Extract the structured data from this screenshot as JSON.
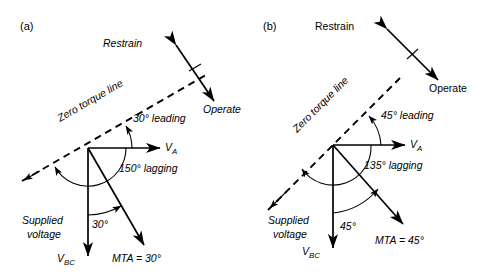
{
  "figure": {
    "type": "vector-phasor-diagram",
    "background": "#ffffff",
    "line_color": "#000000",
    "panels": [
      {
        "id": "a",
        "panel_label": "(a)",
        "labels": {
          "restrain": "Restrain",
          "operate": "Operate",
          "zero_torque_line": "Zero torque line",
          "leading_angle": "30° leading",
          "lagging_angle": "150° lagging",
          "mta_inner_angle": "30°",
          "supplied_voltage_line1": "Supplied",
          "supplied_voltage_line2": "voltage",
          "v_a_main": "V",
          "v_a_sub": "A",
          "v_bc_main": "V",
          "v_bc_sub": "BC",
          "mta": "MTA = 30°"
        },
        "angles_deg": {
          "zero_torque_line_from_va": 30,
          "mta_lagging_from_va": 150,
          "mta_from_vbc": 30,
          "va_direction": 0,
          "vbc_direction": 270
        }
      },
      {
        "id": "b",
        "panel_label": "(b)",
        "labels": {
          "restrain": "Restrain",
          "operate": "Operate",
          "zero_torque_line": "Zero torque line",
          "leading_angle": "45° leading",
          "lagging_angle": "135° lagging",
          "mta_inner_angle": "45°",
          "supplied_voltage_line1": "Supplied",
          "supplied_voltage_line2": "voltage",
          "v_a_main": "V",
          "v_a_sub": "A",
          "v_bc_main": "V",
          "v_bc_sub": "BC",
          "mta": "MTA = 45°"
        },
        "angles_deg": {
          "zero_torque_line_from_va": 45,
          "mta_lagging_from_va": 135,
          "mta_from_vbc": 45,
          "va_direction": 0,
          "vbc_direction": 270
        }
      }
    ]
  }
}
